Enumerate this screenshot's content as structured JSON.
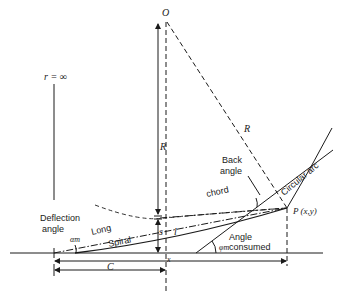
{
  "diagram": {
    "labels": {
      "center": "O",
      "radius_infinite": "r = ∞",
      "radius_vertical": "R",
      "radius_slant": "R",
      "back_angle_line1": "Back",
      "back_angle_line2": "angle",
      "circular_arc": "Circular arc",
      "point_p": "P (x,y)",
      "chord": "chord",
      "long_chord_word1": "Long",
      "spiral_word": "Spiral",
      "length_l": "l",
      "shift_s": "s",
      "deflection_line1": "Deflection",
      "deflection_line2": "angle",
      "alpha_m": "αm",
      "phi_m": "φm",
      "angle_consumed_line1": "Angle",
      "angle_consumed_line2": "consumed",
      "dim_x": "x",
      "dim_c": "C"
    },
    "colors": {
      "ink": "#1a1a1a",
      "background": "#ffffff"
    }
  }
}
